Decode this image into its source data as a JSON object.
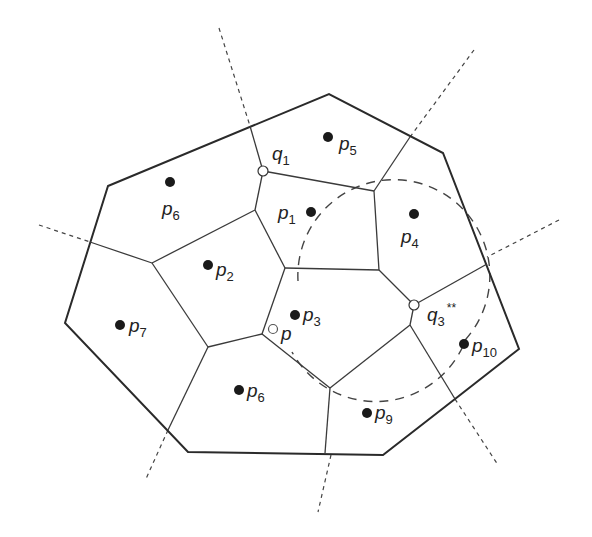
{
  "diagram": {
    "title": "",
    "type": "voronoi-diagram",
    "labels": {
      "p1": {
        "base": "p",
        "sub": "1"
      },
      "p2": {
        "base": "p",
        "sub": "2"
      },
      "p3": {
        "base": "p",
        "sub": "3"
      },
      "p4": {
        "base": "p",
        "sub": "4"
      },
      "p5": {
        "base": "p",
        "sub": "5"
      },
      "p6_top": {
        "base": "p",
        "sub": "6"
      },
      "p6_bottom": {
        "base": "p",
        "sub": "6"
      },
      "p7": {
        "base": "p",
        "sub": "7"
      },
      "p9": {
        "base": "p",
        "sub": "9"
      },
      "p10": {
        "base": "p",
        "sub": "10"
      },
      "p": {
        "base": "p",
        "sub": ""
      },
      "q1": {
        "base": "q",
        "sub": "1"
      },
      "q3": {
        "base": "q",
        "sub": "3",
        "sup": "**"
      }
    },
    "sites": [
      {
        "id": "p1",
        "x": 311,
        "y": 212
      },
      {
        "id": "p2",
        "x": 208,
        "y": 265
      },
      {
        "id": "p3",
        "x": 295,
        "y": 315
      },
      {
        "id": "p4",
        "x": 414,
        "y": 214
      },
      {
        "id": "p5",
        "x": 328,
        "y": 137
      },
      {
        "id": "p6_top",
        "x": 170,
        "y": 182
      },
      {
        "id": "p6_bottom",
        "x": 239,
        "y": 390
      },
      {
        "id": "p7",
        "x": 120,
        "y": 325
      },
      {
        "id": "p9",
        "x": 367,
        "y": 413
      },
      {
        "id": "p10",
        "x": 464,
        "y": 344
      }
    ],
    "voronoi_vertices_marked": [
      {
        "id": "q1",
        "x": 263,
        "y": 171
      },
      {
        "id": "q3",
        "x": 414,
        "y": 305
      }
    ],
    "query_point": {
      "id": "p",
      "x": 273,
      "y": 329
    },
    "dashed_circle": {
      "cx": 374,
      "cy": 307,
      "r": 96
    }
  }
}
